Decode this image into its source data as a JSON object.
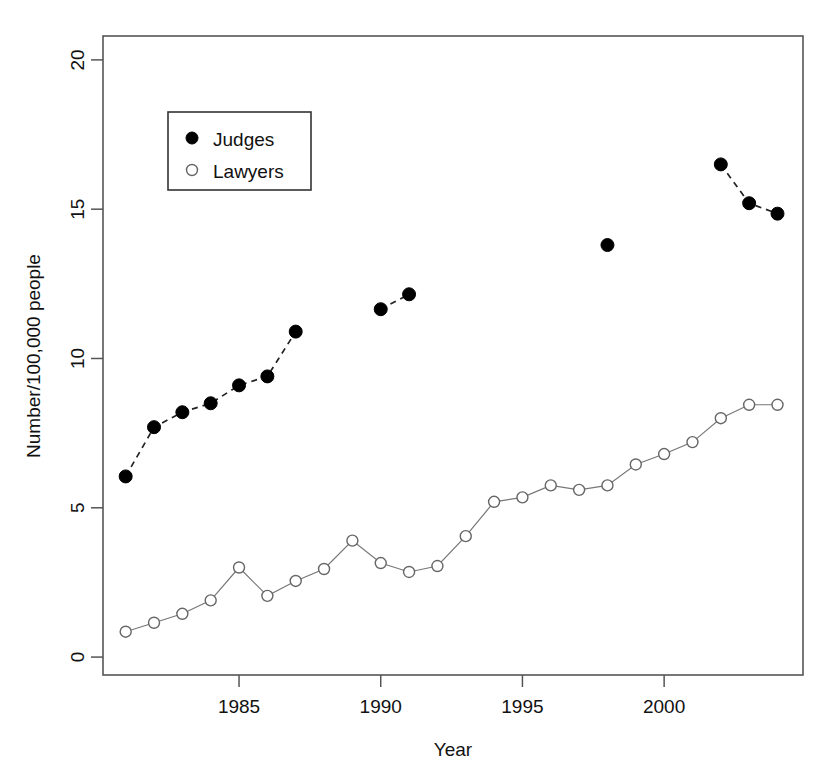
{
  "chart_data": {
    "type": "line",
    "title": "",
    "xlabel": "Year",
    "ylabel": "Number/100,000 people",
    "xlim": [
      1980.2,
      2004.9
    ],
    "ylim": [
      -0.6,
      20.8
    ],
    "grid": false,
    "legend_position": "top-left-inside",
    "x_ticks": [
      1985,
      1990,
      1995,
      2000
    ],
    "x_tick_labels": [
      "1985",
      "1990",
      "1995",
      "2000"
    ],
    "y_ticks": [
      0,
      5,
      10,
      15,
      20
    ],
    "y_tick_labels": [
      "0",
      "5",
      "10",
      "15",
      "20"
    ],
    "series": [
      {
        "name": "Judges",
        "marker": "filled-circle",
        "linestyle": "dashed",
        "color": "#000000",
        "segments": [
          {
            "x": [
              1981,
              1982,
              1983,
              1984,
              1985,
              1986,
              1987
            ],
            "y": [
              6.05,
              7.7,
              8.2,
              8.5,
              9.1,
              9.4,
              10.9
            ]
          },
          {
            "x": [
              1990,
              1991
            ],
            "y": [
              11.65,
              12.15
            ]
          },
          {
            "x": [
              1998
            ],
            "y": [
              13.8
            ]
          },
          {
            "x": [
              2002,
              2003,
              2004
            ],
            "y": [
              16.5,
              15.2,
              14.85
            ]
          }
        ]
      },
      {
        "name": "Lawyers",
        "marker": "open-circle",
        "linestyle": "solid",
        "color": "#777777",
        "segments": [
          {
            "x": [
              1981,
              1982,
              1983,
              1984,
              1985,
              1986,
              1987,
              1988,
              1989,
              1990,
              1991,
              1992,
              1993,
              1994,
              1995,
              1996,
              1997,
              1998,
              1999,
              2000,
              2001,
              2002,
              2003,
              2004
            ],
            "y": [
              0.85,
              1.15,
              1.45,
              1.9,
              3.0,
              2.05,
              2.55,
              2.95,
              3.9,
              3.15,
              2.85,
              3.05,
              4.05,
              5.2,
              5.35,
              5.75,
              5.6,
              5.75,
              6.45,
              6.8,
              7.2,
              8.0,
              8.45,
              8.45
            ]
          }
        ]
      }
    ]
  },
  "legend": {
    "entries": [
      {
        "label": "Judges",
        "marker": "filled-circle"
      },
      {
        "label": "Lawyers",
        "marker": "open-circle"
      }
    ]
  },
  "axes": {
    "x_title": "Year",
    "y_title": "Number/100,000 people"
  }
}
